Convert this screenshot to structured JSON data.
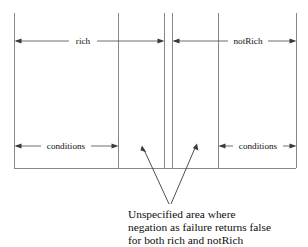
{
  "diagram": {
    "background_color": "#ffffff",
    "line_color": "#7a7a7a",
    "arrow_color": "#3a3a3a",
    "text_color": "#000000",
    "boundaries": [
      {
        "name": "left-edge",
        "x": 14
      },
      {
        "name": "rich-inner-edge",
        "x": 118
      },
      {
        "name": "rich-outer-edge",
        "x": 164
      },
      {
        "name": "notRich-outer-edge",
        "x": 172
      },
      {
        "name": "notRich-inner-edge",
        "x": 218
      },
      {
        "name": "right-edge",
        "x": 296
      }
    ],
    "baseline_y": 168,
    "top_y": 13,
    "spans": [
      {
        "name": "rich-span",
        "label": "rich",
        "x1": 14,
        "x2": 164,
        "y": 41,
        "label_x": 83,
        "arrow_start": true,
        "arrow_end": true
      },
      {
        "name": "notRich-span",
        "label": "notRich",
        "x1": 172,
        "x2": 296,
        "y": 41,
        "label_x": 248,
        "arrow_start": true,
        "arrow_end": true
      },
      {
        "name": "left-conditions-span",
        "label": "conditions",
        "x1": 14,
        "x2": 118,
        "y": 146,
        "label_x": 66,
        "arrow_start": true,
        "arrow_end": true
      },
      {
        "name": "right-conditions-span",
        "label": "conditions",
        "x1": 218,
        "x2": 296,
        "y": 146,
        "label_x": 258,
        "arrow_start": true,
        "arrow_end": true
      }
    ],
    "pointers": [
      {
        "name": "left-pointer",
        "tip_x": 142,
        "tip_y": 146,
        "tail_x": 169,
        "tail_y": 204
      },
      {
        "name": "right-pointer",
        "tip_x": 197,
        "tip_y": 144,
        "tail_x": 171,
        "tail_y": 204
      }
    ],
    "caption": {
      "name": "unspecified-area-caption",
      "x": 128,
      "lines": [
        {
          "text": "Unspecified area where",
          "y": 218
        },
        {
          "text": "negation as failure returns false",
          "y": 231
        },
        {
          "text": "for both rich and notRich",
          "y": 244
        }
      ]
    }
  }
}
